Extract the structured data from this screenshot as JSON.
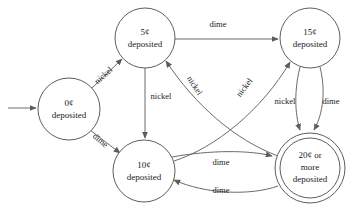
{
  "diagram": {
    "type": "finite-state-machine",
    "stroke_color": "#6b6b6b",
    "text_color": "#1b1b1b",
    "background_color": "#ffffff",
    "states": [
      {
        "id": "s0",
        "line1": "0¢",
        "line2": "deposited",
        "cx": 69,
        "cy": 109,
        "r": 31,
        "accepting": false,
        "start": true
      },
      {
        "id": "s5",
        "line1": "5¢",
        "line2": "deposited",
        "cx": 145,
        "cy": 38,
        "r": 30,
        "accepting": false,
        "start": false
      },
      {
        "id": "s15",
        "line1": "15¢",
        "line2": "deposited",
        "cx": 310,
        "cy": 38,
        "r": 30,
        "accepting": false,
        "start": false
      },
      {
        "id": "s10",
        "line1": "10¢",
        "line2": "deposited",
        "cx": 144,
        "cy": 171,
        "r": 31,
        "accepting": false,
        "start": false
      },
      {
        "id": "s20",
        "line1": "20¢ or",
        "line2": "more",
        "line3": "deposited",
        "cx": 310,
        "cy": 168,
        "r": 35,
        "r_inner": 30,
        "accepting": true,
        "start": false
      }
    ],
    "transitions": [
      {
        "id": "t1",
        "from": "s0",
        "to": "s5",
        "label": "nickel",
        "label_x": 104,
        "label_y": 76,
        "label_rotation": -42
      },
      {
        "id": "t2",
        "from": "s0",
        "to": "s10",
        "label": "dime",
        "label_x": 100,
        "label_y": 141,
        "label_rotation": 40
      },
      {
        "id": "t3",
        "from": "s5",
        "to": "s15",
        "label": "dime",
        "label_x": 218,
        "label_y": 25,
        "label_rotation": 0
      },
      {
        "id": "t4",
        "from": "s5",
        "to": "s10",
        "label": "nickel",
        "label_x": 161,
        "label_y": 97,
        "label_rotation": 0
      },
      {
        "id": "t5",
        "from": "s20",
        "to": "s5",
        "label": "nickel",
        "label_x": 194,
        "label_y": 86,
        "label_rotation": 57
      },
      {
        "id": "t6",
        "from": "s10",
        "to": "s15",
        "label": "nickel",
        "label_x": 245,
        "label_y": 88,
        "label_rotation": -53
      },
      {
        "id": "t7",
        "from": "s15",
        "to": "s20",
        "label": "nickel",
        "label_x": 285,
        "label_y": 102,
        "label_rotation": 0
      },
      {
        "id": "t8",
        "from": "s15",
        "to": "s20",
        "label": "dime",
        "label_x": 331,
        "label_y": 102,
        "label_rotation": 0
      },
      {
        "id": "t9",
        "from": "s10",
        "to": "s20",
        "label": "dime",
        "label_x": 221,
        "label_y": 163,
        "label_rotation": 0
      },
      {
        "id": "t10",
        "from": "s20",
        "to": "s10",
        "label": "dime",
        "label_x": 221,
        "label_y": 191,
        "label_rotation": 0
      }
    ],
    "start_arrow": {
      "name": "start-arrow",
      "x1": 8,
      "y1": 108,
      "x2": 37,
      "y2": 108
    }
  }
}
